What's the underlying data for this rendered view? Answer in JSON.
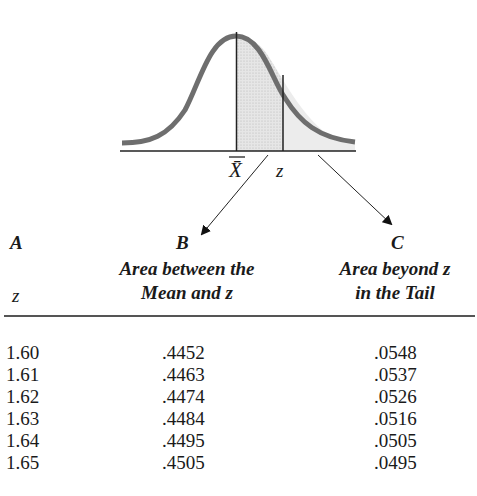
{
  "diagram": {
    "mean_label": "X̄",
    "z_label": "z",
    "curve_color": "#6b6b6b",
    "shade_color": "#d8d8d8"
  },
  "headers": {
    "col_a": {
      "letter": "A",
      "title": "z"
    },
    "col_b": {
      "letter": "B",
      "title_line1": "Area between the",
      "title_line2": "Mean and z"
    },
    "col_c": {
      "letter": "C",
      "title_line1": "Area beyond z",
      "title_line2": "in the Tail"
    }
  },
  "rows": [
    {
      "z": "1.60",
      "b": ".4452",
      "c": ".0548"
    },
    {
      "z": "1.61",
      "b": ".4463",
      "c": ".0537"
    },
    {
      "z": "1.62",
      "b": ".4474",
      "c": ".0526"
    },
    {
      "z": "1.63",
      "b": ".4484",
      "c": ".0516"
    },
    {
      "z": "1.64",
      "b": ".4495",
      "c": ".0505"
    },
    {
      "z": "1.65",
      "b": ".4505",
      "c": ".0495"
    }
  ]
}
